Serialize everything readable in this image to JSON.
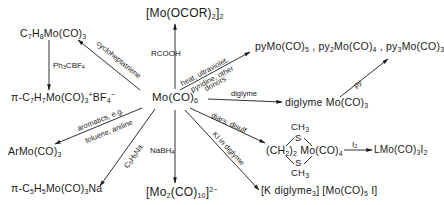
{
  "diagram": {
    "center": {
      "formula": "Mo(CO)",
      "sub": "6"
    },
    "products": {
      "cycloheptatriene_complex": {
        "parts": [
          "C",
          "7",
          "H",
          "8",
          "Mo(CO)",
          "3"
        ]
      },
      "tropylium_salt": {
        "prefix": "π-C",
        "s1": "7",
        "h": "H",
        "s2": "7",
        "mo": "Mo(CO)",
        "s3": "3",
        "plus": "+",
        "bf": "BF",
        "s4": "4",
        "minus": "−"
      },
      "carboxylate_dimer": {
        "open": "[Mo(OCOR)",
        "s1": "2",
        "close": "]",
        "s2": "2"
      },
      "pyridine_complexes": {
        "a": "pyMo(CO)",
        "as": "5",
        "sep1": " , py",
        "bs1": "2",
        "b": "Mo(CO)",
        "bs2": "4",
        "sep2": " , py",
        "cs1": "3",
        "c": "Mo(CO)",
        "cs2": "3"
      },
      "diglyme_complex": {
        "text": "diglyme Mo(CO)",
        "sub": "3"
      },
      "arene_complex": {
        "text": "ArMo(CO)",
        "sub": "3"
      },
      "cyclopentadienyl_salt": {
        "prefix": "π-C",
        "s1": "5",
        "h": "H",
        "s2": "5",
        "mo": "Mo(CO)",
        "s3": "3",
        "na": "Na"
      },
      "decacarbonyl_dianion": {
        "open": "[Mo",
        "s1": "2",
        "mid": "(CO)",
        "s2": "10",
        "close": "]",
        "charge": "2−"
      },
      "dithioether_complex": {
        "ch3_top": "CH",
        "ch3_top_sub": "3",
        "s_top": "S",
        "ch2": "(CH",
        "ch2_sub": "2",
        "ch2_close": ")",
        "ch2_n": "2",
        "mo": "Mo(CO)",
        "mo_sub": "4",
        "s_bot": "S",
        "ch3_bot": "CH",
        "ch3_bot_sub": "3"
      },
      "iodide_salt": {
        "a": "[K diglyme",
        "as": "3",
        "b": "] [Mo(CO)",
        "bs": "5",
        "c": " I]"
      },
      "oxidized_product": {
        "text": "LMo(CO)",
        "s1": "3",
        "i": "I",
        "s2": "2"
      }
    },
    "reagents": {
      "cycloheptatriene": "cycloheptatriene",
      "ph3cbf4": {
        "a": "Ph",
        "s1": "3",
        "b": "CBF",
        "s2": "4"
      },
      "rcooh": "RCOOH",
      "heat_line1": "heat, ultraviolet,",
      "heat_line2": "pyridine, other",
      "heat_line3": "donors",
      "py": "py",
      "diglyme": "diglyme",
      "aromatics_line1": "aromatics, e.g.",
      "aromatics_line2": "toluene, aniline",
      "c5h5na": {
        "a": "C",
        "s1": "5",
        "b": "H",
        "s2": "5",
        "c": "Na"
      },
      "nabh4": {
        "a": "NaBH",
        "s1": "4"
      },
      "diars": "diars, disulf",
      "ki": "KI in diglyme",
      "i2": {
        "a": "I",
        "s1": "2"
      }
    }
  }
}
